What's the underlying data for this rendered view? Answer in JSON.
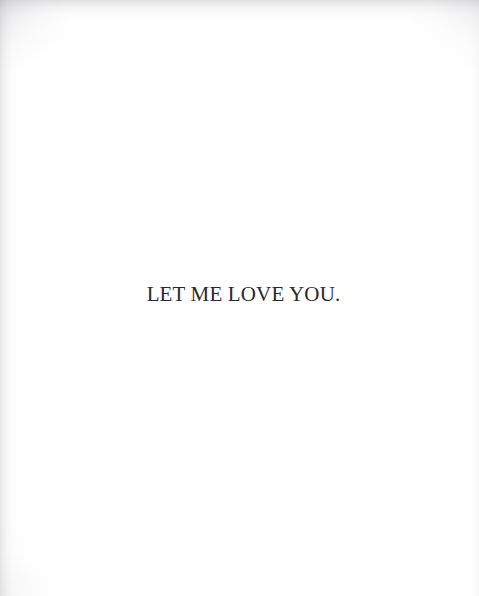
{
  "page": {
    "width": 479,
    "height": 596,
    "background_color": "#ffffff",
    "text_color": "#2a2a2c"
  },
  "content": {
    "quote": "LET ME LOVE YOU."
  }
}
